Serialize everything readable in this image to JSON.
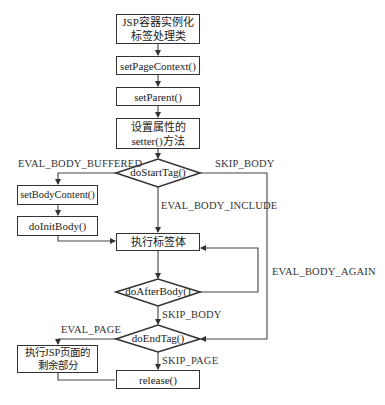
{
  "diagram": {
    "type": "flowchart",
    "nodes": {
      "instantiate": {
        "line1": "JSP容器实例化",
        "line2": "标签处理类"
      },
      "set_page_context": {
        "label": "setPageContext()"
      },
      "set_parent": {
        "label": "setParent()"
      },
      "setters": {
        "line1": "设置属性的",
        "line2": "setter()方法"
      },
      "do_start_tag": {
        "label": "doStartTag()"
      },
      "set_body_content": {
        "label": "setBodyContent()"
      },
      "do_init_body": {
        "label": "doInitBody()"
      },
      "exec_body": {
        "label": "执行标签体"
      },
      "do_after_body": {
        "label": "doAfterBody()"
      },
      "do_end_tag": {
        "label": "doEndTag()"
      },
      "exec_rest": {
        "line1": "执行JSP页面的",
        "line2": "剩余部分"
      },
      "release": {
        "label": "release()"
      }
    },
    "edge_labels": {
      "eval_body_buffered": "EVAL_BODY_BUFFERED",
      "skip_body_start": "SKIP_BODY",
      "eval_body_include": "EVAL_BODY_INCLUDE",
      "eval_body_again": "EVAL_BODY_AGAIN",
      "skip_body_after": "SKIP_BODY",
      "eval_page": "EVAL_PAGE",
      "skip_page": "SKIP_PAGE"
    },
    "colors": {
      "stroke": "#333333",
      "background": "#ffffff",
      "text": "#222222"
    }
  }
}
